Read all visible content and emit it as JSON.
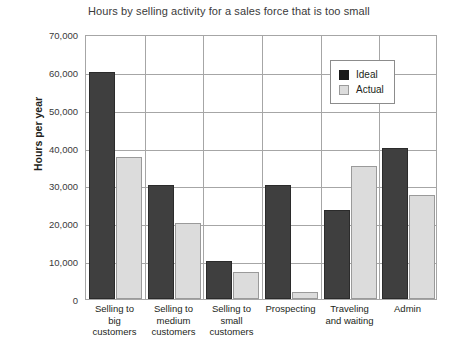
{
  "chart_data": {
    "type": "bar",
    "title": "Hours by selling activity for a sales force that is too small",
    "xlabel": "",
    "ylabel": "Hours per year",
    "ylim": [
      0,
      70000
    ],
    "ytick_step": 10000,
    "ytick_labels": [
      "70,000",
      "60,000",
      "50,000",
      "40,000",
      "30,000",
      "20,000",
      "10,000",
      "0"
    ],
    "ytick_values": [
      70000,
      60000,
      50000,
      40000,
      30000,
      20000,
      10000,
      0
    ],
    "grid": true,
    "legend_position": "top-right",
    "categories": [
      "Selling to big customers",
      "Selling to medium customers",
      "Selling to small customers",
      "Prospecting",
      "Traveling and waiting",
      "Admin"
    ],
    "category_label_lines": [
      [
        "Selling to",
        "big",
        "customers"
      ],
      [
        "Selling to",
        "medium",
        "customers"
      ],
      [
        "Selling to",
        "small",
        "customers"
      ],
      [
        "Prospecting"
      ],
      [
        "Traveling",
        "and waiting"
      ],
      [
        "Admin"
      ]
    ],
    "series": [
      {
        "name": "Ideal",
        "color": "#3f3f3f",
        "values": [
          60000,
          30000,
          10000,
          30000,
          23500,
          40000
        ]
      },
      {
        "name": "Actual",
        "color": "#dcdcdc",
        "values": [
          37500,
          20000,
          7000,
          1800,
          35000,
          27500
        ]
      }
    ]
  },
  "legend": {
    "items": [
      {
        "label": "Ideal",
        "swatch": "ideal-swatch"
      },
      {
        "label": "Actual",
        "swatch": "actual-swatch"
      }
    ]
  }
}
